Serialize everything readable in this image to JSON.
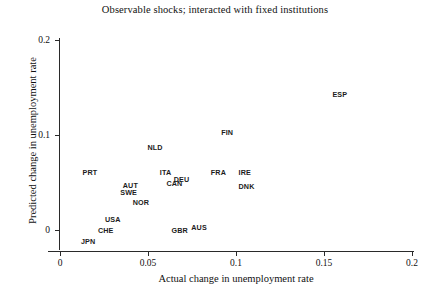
{
  "chart_data": {
    "type": "scatter",
    "title": "Observable shocks; interacted with fixed institutions",
    "xlabel": "Actual change in unemployment rate",
    "ylabel": "Predicted change in unemployment rate",
    "xlim": [
      0,
      0.2
    ],
    "ylim": [
      0,
      0.2
    ],
    "xticks": [
      0,
      0.05,
      0.1,
      0.15,
      0.2
    ],
    "xtick_labels": [
      "0",
      "0.05",
      "0.1",
      "0.15",
      "0.2"
    ],
    "yticks": [
      0,
      0.1,
      0.2
    ],
    "ytick_labels": [
      "0",
      "0.1",
      "0.2"
    ],
    "grid": false,
    "legend": "none",
    "marker_style": "text-label-only",
    "points": [
      {
        "label": "ESP",
        "x": 0.159,
        "y": 0.142
      },
      {
        "label": "FIN",
        "x": 0.095,
        "y": 0.102
      },
      {
        "label": "NLD",
        "x": 0.054,
        "y": 0.086
      },
      {
        "label": "PRT",
        "x": 0.017,
        "y": 0.06
      },
      {
        "label": "ITA",
        "x": 0.06,
        "y": 0.06
      },
      {
        "label": "FRA",
        "x": 0.09,
        "y": 0.06
      },
      {
        "label": "IRE",
        "x": 0.105,
        "y": 0.06
      },
      {
        "label": "DEU",
        "x": 0.069,
        "y": 0.053
      },
      {
        "label": "CAN",
        "x": 0.065,
        "y": 0.048
      },
      {
        "label": "DNK",
        "x": 0.106,
        "y": 0.045
      },
      {
        "label": "AUT",
        "x": 0.04,
        "y": 0.046
      },
      {
        "label": "SWE",
        "x": 0.039,
        "y": 0.039
      },
      {
        "label": "NOR",
        "x": 0.046,
        "y": 0.028
      },
      {
        "label": "USA",
        "x": 0.03,
        "y": 0.011
      },
      {
        "label": "AUS",
        "x": 0.079,
        "y": 0.002
      },
      {
        "label": "CHE",
        "x": 0.026,
        "y": -0.001
      },
      {
        "label": "GBR",
        "x": 0.068,
        "y": -0.001
      },
      {
        "label": "JPN",
        "x": 0.016,
        "y": -0.013
      }
    ]
  }
}
